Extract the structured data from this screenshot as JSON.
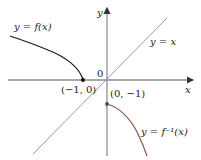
{
  "diagram": {
    "title": "",
    "axes": {
      "x_label": "x",
      "y_label": "y",
      "origin_label": "0"
    },
    "curves": [
      {
        "name": "f",
        "label": "y = f(x)",
        "color": "#1a1a1a"
      },
      {
        "name": "identity",
        "label": "y = x",
        "color": "#9a9a9a"
      },
      {
        "name": "f-inverse",
        "label": "y = f⁻¹(x)",
        "color": "#8a5a4a"
      }
    ],
    "points": [
      {
        "label": "(−1, 0)"
      },
      {
        "label": "(0, −1)"
      }
    ]
  }
}
